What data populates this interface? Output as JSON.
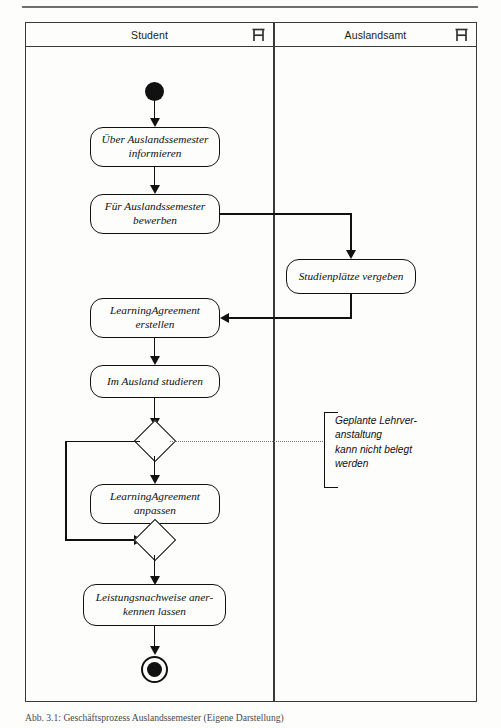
{
  "figure": {
    "type": "uml-activity-diagram",
    "caption": "Abb. 3.1: Geschäftsprozess Auslandssemester (Eigene Darstellung)"
  },
  "lanes": [
    {
      "id": "student",
      "title": "Student",
      "icon": "swimlane-actor-icon"
    },
    {
      "id": "auslandsamt",
      "title": "Auslandsamt",
      "icon": "swimlane-actor-icon"
    }
  ],
  "nodes": {
    "initial": {
      "label": "",
      "kind": "initial-node"
    },
    "a1": {
      "label": "Über Auslandssemester\ninformieren",
      "kind": "action"
    },
    "a2": {
      "label": "Für Auslandssemester\nbewerben",
      "kind": "action"
    },
    "a3": {
      "label": "Studienplätze vergeben",
      "kind": "action"
    },
    "a4": {
      "label": "LearningAgreement\nerstellen",
      "kind": "action"
    },
    "a5": {
      "label": "Im Ausland studieren",
      "kind": "action"
    },
    "d1": {
      "label": "",
      "kind": "decision"
    },
    "a6": {
      "label": "LearningAgreement\nanpassen",
      "kind": "action"
    },
    "d2": {
      "label": "",
      "kind": "merge"
    },
    "a7": {
      "label": "Leistungsnachweise aner-\nkennen lassen",
      "kind": "action"
    },
    "final": {
      "label": "",
      "kind": "final-node"
    }
  },
  "note": {
    "text": "Geplante Lehrver-\nanstaltung\nkann nicht belegt\nwerden"
  },
  "colors": {
    "line": "#111111",
    "frame": "#3a3a3a",
    "paper": "#fdfdfc",
    "note_anchor": "#777777"
  }
}
